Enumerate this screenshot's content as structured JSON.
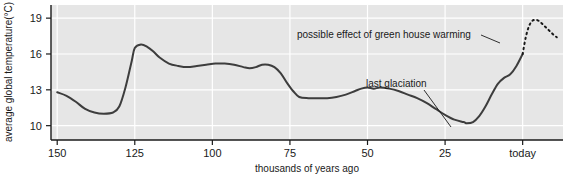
{
  "chart_data": {
    "type": "line",
    "title": "",
    "xlabel": "thousands of years ago",
    "ylabel": "average global temperature(°C)",
    "x_tick_labels": [
      "150",
      "125",
      "100",
      "75",
      "50",
      "25",
      "today"
    ],
    "x_tick_values": [
      150,
      125,
      100,
      75,
      50,
      25,
      0
    ],
    "y_tick_labels": [
      "19",
      "16",
      "13",
      "10"
    ],
    "y_tick_values": [
      19,
      16,
      13,
      10
    ],
    "xlim": [
      152,
      -13
    ],
    "ylim": [
      8.8,
      20.1
    ],
    "x_axis_direction": "reversed",
    "grid": true,
    "grid_color": "#ffffff",
    "plot_background": "#e6e6e6",
    "legend": "none",
    "series": [
      {
        "name": "reconstructed average global temperature",
        "style": "solid",
        "color": "#3d3d3d",
        "x": [
          150,
          147,
          144,
          141,
          138,
          135,
          132,
          130,
          128,
          126,
          125,
          123,
          121,
          119,
          117,
          114,
          111,
          108,
          105,
          102,
          99,
          96,
          93,
          90,
          88,
          86,
          84,
          82,
          80,
          78,
          76,
          74,
          72,
          69,
          66,
          63,
          60,
          57,
          54,
          52,
          50,
          48,
          46,
          43,
          40,
          37,
          34,
          31,
          28,
          25,
          22,
          19,
          18,
          16,
          14,
          12,
          10,
          8,
          6,
          4,
          2,
          0
        ],
        "y": [
          12.8,
          12.5,
          12.0,
          11.4,
          11.1,
          11.0,
          11.1,
          11.6,
          13.2,
          15.4,
          16.5,
          16.8,
          16.6,
          16.2,
          15.7,
          15.2,
          15.0,
          14.9,
          15.0,
          15.1,
          15.2,
          15.2,
          15.1,
          14.9,
          14.8,
          14.9,
          15.1,
          15.1,
          14.9,
          14.4,
          13.6,
          12.9,
          12.4,
          12.3,
          12.3,
          12.3,
          12.4,
          12.6,
          12.9,
          13.1,
          13.2,
          13.1,
          13.2,
          13.1,
          12.9,
          12.6,
          12.3,
          11.9,
          11.4,
          10.9,
          10.5,
          10.3,
          10.2,
          10.3,
          10.8,
          11.6,
          12.6,
          13.5,
          14.0,
          14.3,
          15.0,
          16.0
        ]
      },
      {
        "name": "possible effect of green house warming (projection)",
        "style": "dotted",
        "color": "#1a1a1a",
        "x": [
          0,
          -1,
          -2,
          -3,
          -4,
          -5,
          -6,
          -7,
          -8,
          -9,
          -10,
          -11
        ],
        "y": [
          16.0,
          17.4,
          18.3,
          18.75,
          18.85,
          18.8,
          18.6,
          18.35,
          18.1,
          17.85,
          17.6,
          17.4
        ]
      }
    ],
    "annotations": [
      {
        "id": "greenhouse-annotation",
        "text": "possible effect of green house warming",
        "text_x": 297,
        "text_y": 38,
        "leader_from_x": 481,
        "leader_from_y": 35,
        "leader_to_x": 500,
        "leader_to_y": 43
      },
      {
        "id": "glaciation-annotation",
        "text": "last glaciation",
        "text_x": 366,
        "text_y": 87,
        "leader_from_x": 424,
        "leader_from_y": 90,
        "leader_to_x": 451,
        "leader_to_y": 127
      }
    ]
  }
}
